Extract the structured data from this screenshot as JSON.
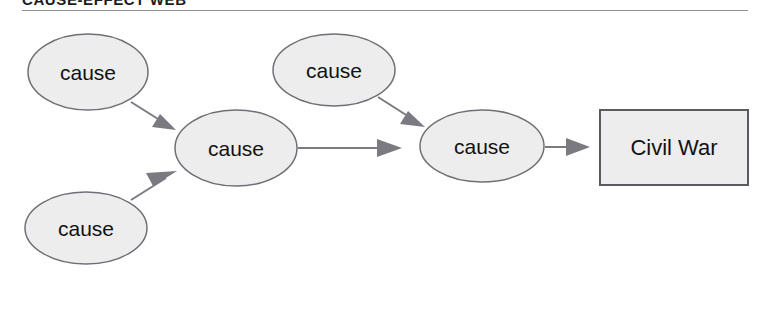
{
  "page": {
    "width": 765,
    "height": 323,
    "background": "#ffffff"
  },
  "header": {
    "title": "CAUSE-EFFECT WEB",
    "rule_color": "#8e8e94"
  },
  "colors": {
    "node_fill": "#ededed",
    "node_stroke": "#6f6f75",
    "box_stroke": "#5a5a60",
    "edge": "#7a7a80",
    "text": "#121212"
  },
  "diagram": {
    "type": "cause-effect-web",
    "nodes": [
      {
        "id": "cause-1",
        "label": "cause",
        "shape": "ellipse",
        "cx": 88,
        "cy": 72,
        "rx": 60,
        "ry": 38
      },
      {
        "id": "cause-2",
        "label": "cause",
        "shape": "ellipse",
        "cx": 236,
        "cy": 148,
        "rx": 61,
        "ry": 38
      },
      {
        "id": "cause-3",
        "label": "cause",
        "shape": "ellipse",
        "cx": 334,
        "cy": 70,
        "rx": 61,
        "ry": 36
      },
      {
        "id": "cause-4",
        "label": "cause",
        "shape": "ellipse",
        "cx": 482,
        "cy": 146,
        "rx": 62,
        "ry": 36
      },
      {
        "id": "cause-5",
        "label": "cause",
        "shape": "ellipse",
        "cx": 86,
        "cy": 228,
        "rx": 61,
        "ry": 36
      },
      {
        "id": "effect-civil-war",
        "label": "Civil War",
        "shape": "rectangle",
        "x": 600,
        "y": 110,
        "w": 148,
        "h": 75
      }
    ],
    "edges": [
      {
        "id": "edge-1",
        "from": "cause-1",
        "to": "cause-2",
        "direction": "down-right"
      },
      {
        "id": "edge-2",
        "from": "cause-5",
        "to": "cause-2",
        "direction": "up-right"
      },
      {
        "id": "edge-3",
        "from": "cause-2",
        "to": "cause-4",
        "direction": "right"
      },
      {
        "id": "edge-4",
        "from": "cause-3",
        "to": "cause-4",
        "direction": "down-right"
      },
      {
        "id": "edge-5",
        "from": "cause-4",
        "to": "effect-civil-war",
        "direction": "right"
      }
    ]
  }
}
